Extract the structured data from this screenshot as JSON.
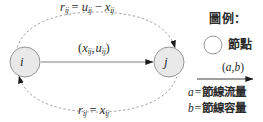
{
  "diagram": {
    "type": "residual-network-arc",
    "nodes": [
      {
        "id": "i",
        "label": "i",
        "fill": "#e9e9e9",
        "stroke": "#8a8a8a",
        "cx": 25,
        "cy": 62,
        "r": 15
      },
      {
        "id": "j",
        "label": "j",
        "fill": "#e9e9e9",
        "stroke": "#8a8a8a",
        "cx": 169,
        "cy": 62,
        "r": 15
      }
    ],
    "edges": [
      {
        "name": "forward-arc",
        "style": "solid",
        "from": "i",
        "to": "j",
        "label": {
          "lhs": "(",
          "x": "x",
          "xsub": "ij",
          "sep": ",",
          "u": "u",
          "usub": "ij",
          "rhs": ")"
        }
      },
      {
        "name": "residual-forward-arc",
        "style": "dashed",
        "from": "i",
        "to": "j",
        "label": {
          "r": "r",
          "rsub": "ij",
          "eq": "=",
          "u": "u",
          "usub": "ij",
          "minus": "−",
          "x": "x",
          "xsub": "ij"
        }
      },
      {
        "name": "residual-backward-arc",
        "style": "dashed",
        "from": "j",
        "to": "i",
        "label": {
          "r": "r",
          "rsub": "ij",
          "eq": "=",
          "x": "x",
          "xsub": "ij"
        }
      }
    ],
    "colors": {
      "node_fill": "#e9e9e9",
      "node_stroke": "#8a8a8a",
      "solid_line": "#6f6f6f",
      "dashed_line": "#9a9a9a",
      "arrow_fill": "#1a1a1a",
      "text": "#2b2b2b",
      "background": "#ffffff"
    }
  },
  "legend": {
    "title": "圖例：",
    "node_entry": {
      "symbol": "circle",
      "label": "節點"
    },
    "arc_entry": {
      "symbol": "arrow",
      "label_open": "(",
      "a": "a",
      "comma": ",",
      "b": "b",
      "label_close": ")"
    },
    "definitions": [
      {
        "symbol": "a",
        "eq": "=",
        "text": "節線流量"
      },
      {
        "symbol": "b",
        "eq": "=",
        "text": "節線容量"
      }
    ]
  }
}
